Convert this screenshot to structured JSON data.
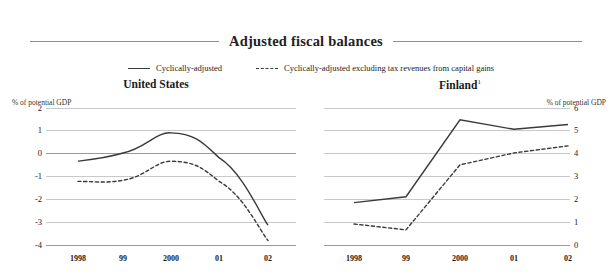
{
  "figure": {
    "title": "Adjusted fiscal balances",
    "legend": [
      {
        "label": "Cyclically-adjusted",
        "style": "solid"
      },
      {
        "label": "Cyclically-adjusted excluding tax revenues from capital gains",
        "style": "dashed"
      }
    ]
  },
  "panels": {
    "us": {
      "title": "United States",
      "axis_note": "% of potential GDP",
      "yticks": [
        "2",
        "1",
        "0",
        "-1",
        "-2",
        "-3",
        "-4"
      ],
      "xticks": [
        "1998",
        "99",
        "2000",
        "01",
        "02"
      ]
    },
    "fi": {
      "title": "Finland",
      "title_superscript": "1",
      "axis_note": "% of potential GDP",
      "yticks": [
        "6",
        "5",
        "4",
        "3",
        "2",
        "1",
        "0"
      ],
      "xticks": [
        "1998",
        "99",
        "2000",
        "01",
        "02"
      ]
    }
  },
  "chart_data": [
    {
      "type": "line",
      "title": "United States",
      "subtitle": "Adjusted fiscal balances",
      "xlabel": "",
      "ylabel": "% of potential GDP",
      "categories": [
        "1998",
        "99",
        "2000",
        "01",
        "02"
      ],
      "x": [
        1998,
        1999,
        2000,
        2001,
        2002
      ],
      "ylim": [
        -4,
        2
      ],
      "yticks": [
        2,
        1,
        0,
        -1,
        -2,
        -3,
        -4
      ],
      "grid": true,
      "legend_position": "top",
      "series": [
        {
          "name": "Cyclically-adjusted",
          "style": "solid",
          "values": [
            -0.25,
            0.1,
            0.95,
            -0.1,
            -2.95
          ]
        },
        {
          "name": "Cyclically-adjusted excluding tax revenues from capital gains",
          "style": "dashed",
          "values": [
            -1.1,
            -1.05,
            -0.25,
            -1.1,
            -3.6
          ]
        }
      ]
    },
    {
      "type": "line",
      "title": "Finland",
      "subtitle": "Adjusted fiscal balances",
      "xlabel": "",
      "ylabel": "% of potential GDP",
      "categories": [
        "1998",
        "99",
        "2000",
        "01",
        "02"
      ],
      "x": [
        1998,
        1999,
        2000,
        2001,
        2002
      ],
      "ylim": [
        0,
        6
      ],
      "yticks": [
        6,
        5,
        4,
        3,
        2,
        1,
        0
      ],
      "grid": true,
      "legend_position": "top",
      "series": [
        {
          "name": "Cyclically-adjusted",
          "style": "solid",
          "values": [
            2.0,
            2.25,
            5.5,
            5.1,
            5.3
          ]
        },
        {
          "name": "Cyclically-adjusted excluding tax revenues from capital gains",
          "style": "dashed",
          "values": [
            1.1,
            0.85,
            3.6,
            4.1,
            4.4
          ]
        }
      ]
    }
  ]
}
